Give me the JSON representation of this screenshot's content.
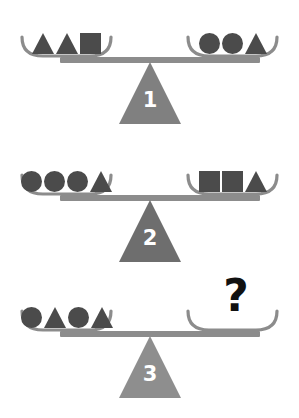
{
  "colors": {
    "shape": "#4b4b4b",
    "beam": "#8c8c8c",
    "pan": "#8c8c8c",
    "background": "#ffffff",
    "question_mark": "#111111",
    "fulcrum_1": "#808080",
    "fulcrum_2": "#6e6e6e",
    "fulcrum_3": "#8e8e8e"
  },
  "balances": [
    {
      "id": "balance-1",
      "fulcrum_label": "1",
      "fulcrum_color": "#808080",
      "left_pan": {
        "shapes": [
          "triangle",
          "triangle",
          "square"
        ],
        "shape_count": 3
      },
      "right_pan": {
        "shapes": [
          "circle",
          "circle",
          "triangle"
        ],
        "shape_count": 3
      },
      "unknown": false
    },
    {
      "id": "balance-2",
      "fulcrum_label": "2",
      "fulcrum_color": "#6e6e6e",
      "left_pan": {
        "shapes": [
          "circle",
          "circle",
          "circle",
          "triangle"
        ],
        "shape_count": 4
      },
      "right_pan": {
        "shapes": [
          "square",
          "square",
          "triangle"
        ],
        "shape_count": 3
      },
      "unknown": false
    },
    {
      "id": "balance-3",
      "fulcrum_label": "3",
      "fulcrum_color": "#8e8e8e",
      "left_pan": {
        "shapes": [
          "circle",
          "triangle",
          "circle",
          "triangle"
        ],
        "shape_count": 4
      },
      "right_pan": {
        "shapes": [],
        "shape_count": 0
      },
      "unknown": true,
      "unknown_label": "?"
    }
  ]
}
